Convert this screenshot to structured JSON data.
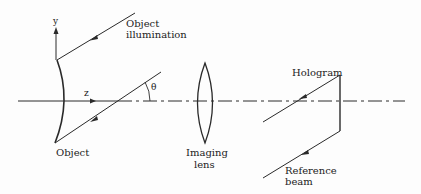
{
  "diagram": {
    "type": "holography-recording-setup",
    "labels": {
      "y_axis": "y",
      "z_axis": "z",
      "angle": "θ",
      "object_illumination_line1": "Object",
      "object_illumination_line2": "illumination",
      "object": "Object",
      "imaging_lens_line1": "Imaging",
      "imaging_lens_line2": "lens",
      "hologram": "Hologram",
      "reference_beam_line1": "Reference",
      "reference_beam_line2": "beam"
    },
    "colors": {
      "line": "#2a2a2a",
      "background": "#fdfdfd"
    }
  }
}
